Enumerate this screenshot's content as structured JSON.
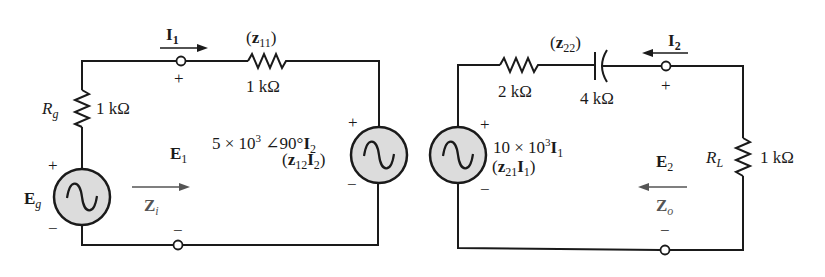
{
  "diagram": {
    "type": "two-port z-parameter equivalent circuit",
    "colors": {
      "wire": "#1a1a1a",
      "source_fill": "#dcdcdc",
      "arrow_gray": "#555555"
    },
    "input_port": {
      "current": {
        "symbol": "I",
        "sub": "1"
      },
      "voltage": {
        "symbol": "E",
        "sub": "1"
      },
      "impedance": {
        "symbol": "Z",
        "sub": "i"
      },
      "plus": "+",
      "minus": "−"
    },
    "output_port": {
      "current": {
        "symbol": "I",
        "sub": "2"
      },
      "voltage": {
        "symbol": "E",
        "sub": "2"
      },
      "impedance": {
        "symbol": "Z",
        "sub": "o"
      },
      "plus": "+",
      "minus": "−"
    },
    "generator": {
      "name": {
        "symbol": "E",
        "sub": "g"
      },
      "plus": "+",
      "minus": "−"
    },
    "Rg": {
      "symbol": "R",
      "sub": "g",
      "value": "1 kΩ"
    },
    "z11": {
      "label_open": "(",
      "symbol": "z",
      "sub": "11",
      "label_close": ")",
      "value": "1 kΩ"
    },
    "z12_source": {
      "expr_coef": "5 × 10",
      "expr_exp": "3",
      "expr_angle": " ∠90°",
      "expr_var": "I",
      "expr_var_sub": "2",
      "paren_open": "(",
      "param": "z",
      "param_sub": "12",
      "param_var": "I",
      "param_var_sub": "2",
      "paren_close": ")",
      "plus": "+",
      "minus": "−"
    },
    "z21_source": {
      "expr_coef": "10 × 10",
      "expr_exp": "3",
      "expr_var": "I",
      "expr_var_sub": "1",
      "paren_open": "(",
      "param": "z",
      "param_sub": "21",
      "param_var": "I",
      "param_var_sub": "1",
      "paren_close": ")",
      "plus": "+",
      "minus": "−"
    },
    "z22": {
      "label_open": "(",
      "symbol": "z",
      "sub": "22",
      "label_close": ")",
      "resistor_value": "2 kΩ",
      "capacitor_value": "4 kΩ"
    },
    "RL": {
      "symbol": "R",
      "sub": "L",
      "value": "1 kΩ"
    }
  }
}
